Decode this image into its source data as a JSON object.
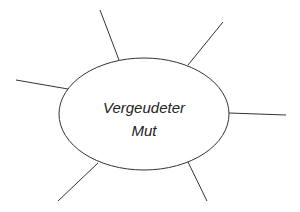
{
  "diagram": {
    "type": "mind-map",
    "center": {
      "lines": [
        "Vergeudeter",
        "Mut"
      ],
      "shape": "ellipse",
      "cx": 144,
      "cy": 114,
      "rx": 85,
      "ry": 56
    },
    "branches": [
      {
        "name": "branch-top-left",
        "x1": 119,
        "y1": 60,
        "x2": 100,
        "y2": 10
      },
      {
        "name": "branch-top-right",
        "x1": 188,
        "y1": 65,
        "x2": 223,
        "y2": 22
      },
      {
        "name": "branch-left",
        "x1": 68,
        "y1": 89,
        "x2": 16,
        "y2": 80
      },
      {
        "name": "branch-right",
        "x1": 229,
        "y1": 113,
        "x2": 286,
        "y2": 115
      },
      {
        "name": "branch-bottom-left",
        "x1": 98,
        "y1": 163,
        "x2": 58,
        "y2": 201
      },
      {
        "name": "branch-bottom-right",
        "x1": 188,
        "y1": 162,
        "x2": 207,
        "y2": 201
      }
    ],
    "colors": {
      "stroke": "#333333",
      "text": "#222222",
      "background": "#ffffff"
    }
  }
}
